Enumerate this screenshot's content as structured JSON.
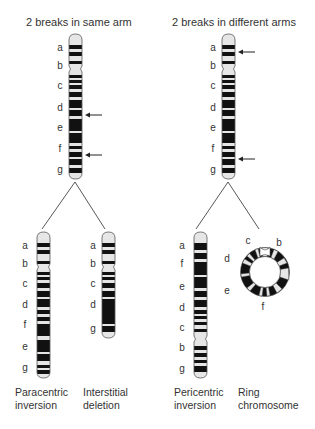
{
  "titles": {
    "left": "2 breaks in same arm",
    "right": "2 breaks in different arms"
  },
  "original_left": {
    "labels": [
      "a",
      "b",
      "c",
      "d",
      "e",
      "f",
      "g"
    ],
    "break_arrows": [
      "between d and e",
      "between f and g"
    ]
  },
  "original_right": {
    "labels": [
      "a",
      "b",
      "c",
      "d",
      "e",
      "f",
      "g"
    ],
    "break_arrows": [
      "in a",
      "between f and g"
    ]
  },
  "paracentric": {
    "labels": [
      "a",
      "b",
      "c",
      "d",
      "f",
      "e",
      "g"
    ],
    "caption_line1": "Paracentric",
    "caption_line2": "inversion"
  },
  "deletion": {
    "labels": [
      "a",
      "b",
      "c",
      "d",
      "g"
    ],
    "caption_line1": "Interstitial",
    "caption_line2": "deletion"
  },
  "pericentric": {
    "labels": [
      "a",
      "f",
      "e",
      "d",
      "c",
      "b",
      "g"
    ],
    "caption_line1": "Pericentric",
    "caption_line2": "inversion"
  },
  "ring": {
    "labels": [
      "c",
      "b",
      "d",
      "e",
      "f"
    ],
    "caption_line1": "Ring",
    "caption_line2": "chromosome"
  },
  "colors": {
    "band_dark": "#111111",
    "band_light": "#e6e6e6",
    "outline": "#555555",
    "line": "#444444"
  }
}
